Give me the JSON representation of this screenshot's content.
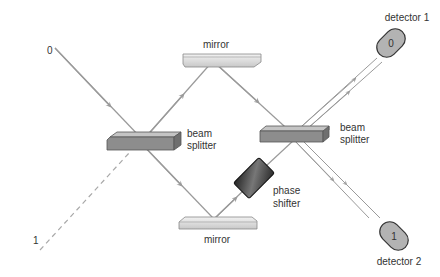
{
  "diagram": {
    "type": "Mach-Zehnder interferometer",
    "colors": {
      "beam": "#9a9a9a",
      "beam_dashed": "#a8a8a8",
      "splitter_top": "#b8b8b8",
      "splitter_front": "#8d8d8d",
      "mirror_top": "#e6e6e6",
      "mirror_front": "#cfcfcf",
      "detector_fill": "#b3b3b3",
      "phase_shifter": "#3a3a3a",
      "text": "#333333"
    },
    "inputs": {
      "port_0": "0",
      "port_1": "1"
    },
    "components": {
      "mirror_top": "mirror",
      "mirror_bottom": "mirror",
      "beam_splitter_left": {
        "line1": "beam",
        "line2": "splitter"
      },
      "beam_splitter_right": {
        "line1": "beam",
        "line2": "splitter"
      },
      "phase_shifter": {
        "line1": "phase",
        "line2": "shifter"
      }
    },
    "detectors": [
      {
        "label": "detector 1",
        "value": "0"
      },
      {
        "label": "detector 2",
        "value": "1"
      }
    ]
  }
}
